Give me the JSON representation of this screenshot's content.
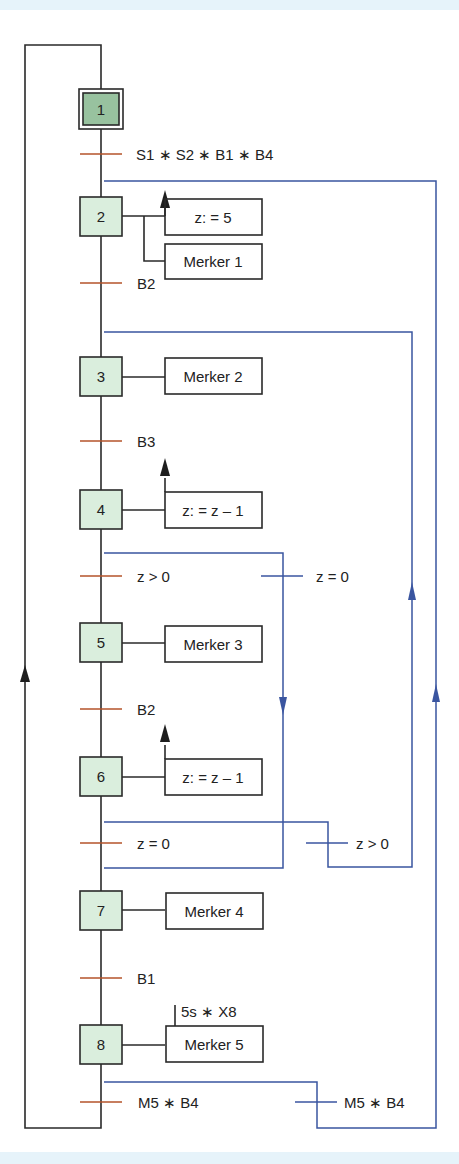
{
  "diagram": {
    "type": "sequential-function-chart",
    "colors": {
      "line": "#2a2a2a",
      "step_fill": "#daeedd",
      "initial_step_fill": "#98c29f",
      "transition_tick": "#b5532a",
      "branch_line": "#3a55a0",
      "background_band": "#e6f3fa"
    },
    "steps": [
      {
        "id": "1",
        "label": "1",
        "initial": true
      },
      {
        "id": "2",
        "label": "2"
      },
      {
        "id": "3",
        "label": "3"
      },
      {
        "id": "4",
        "label": "4"
      },
      {
        "id": "5",
        "label": "5"
      },
      {
        "id": "6",
        "label": "6"
      },
      {
        "id": "7",
        "label": "7"
      },
      {
        "id": "8",
        "label": "8"
      }
    ],
    "actions": [
      {
        "step": "2",
        "label": "z: = 5"
      },
      {
        "step": "2",
        "label": "Merker 1"
      },
      {
        "step": "3",
        "label": "Merker 2"
      },
      {
        "step": "4",
        "label": "z: = z – 1"
      },
      {
        "step": "5",
        "label": "Merker 3"
      },
      {
        "step": "6",
        "label": "z: = z – 1"
      },
      {
        "step": "7",
        "label": "Merker 4"
      },
      {
        "step": "8",
        "label": "Merker 5",
        "qualifier": "5s ∗ X8"
      }
    ],
    "transitions": [
      {
        "after": "1",
        "label": "S1 ∗ S2 ∗ B1 ∗ B4"
      },
      {
        "after": "2",
        "label": "B2"
      },
      {
        "after": "3",
        "label": "B3"
      },
      {
        "after": "4",
        "label": "z > 0"
      },
      {
        "after": "5",
        "label": "B2"
      },
      {
        "after": "6",
        "label": "z = 0"
      },
      {
        "after": "7",
        "label": "B1"
      },
      {
        "after": "8",
        "label": "M5 ∗ B4"
      }
    ],
    "branch_transitions": [
      {
        "from": "4",
        "to": "7",
        "label": "z = 0"
      },
      {
        "from": "6",
        "to": "3",
        "label": "z > 0"
      },
      {
        "from": "8",
        "to": "2",
        "label": "M5 ∗ B4"
      }
    ]
  }
}
